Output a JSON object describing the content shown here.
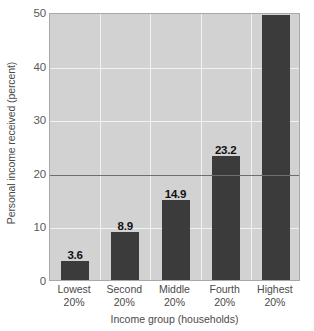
{
  "chart_data": {
    "type": "bar",
    "title": "",
    "xlabel": "Income group (households)",
    "ylabel": "Personal income received (percent)",
    "categories": [
      "Lowest 20%",
      "Second 20%",
      "Middle 20%",
      "Fourth 20%",
      "Highest 20%"
    ],
    "category_lines": [
      [
        "Lowest",
        "20%"
      ],
      [
        "Second",
        "20%"
      ],
      [
        "Middle",
        "20%"
      ],
      [
        "Fourth",
        "20%"
      ],
      [
        "Highest",
        "20%"
      ]
    ],
    "values": [
      3.6,
      8.9,
      14.9,
      23.2,
      49.4
    ],
    "value_labels": [
      "3.6",
      "8.9",
      "14.9",
      "23.2",
      "49.4"
    ],
    "ylim": [
      0,
      50
    ],
    "yticks": [
      0,
      10,
      20,
      30,
      40,
      50
    ],
    "ytick_labels": [
      "0",
      "10",
      "20",
      "30",
      "40",
      "50"
    ],
    "grid": true,
    "gridlines_horizontal": [
      10,
      20,
      30,
      40
    ],
    "highlighted_gridline": 20,
    "legend": "none",
    "colors": {
      "bar": "#3b3b3b",
      "plot_background": "#d2d2d2",
      "gridline": "#f2f2f2",
      "highlight_line": "#6e6e6e",
      "frame": "#a8a8a8",
      "value_label": "#111111",
      "axis_text": "#4a4a4a",
      "page_background": "#ffffff"
    }
  }
}
